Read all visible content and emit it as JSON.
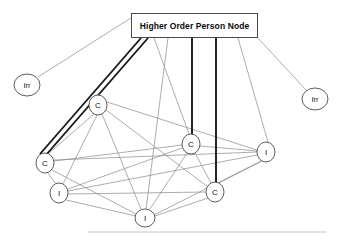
{
  "diagram": {
    "title_node": {
      "label": "Higher Order Person Node",
      "box": {
        "x": 131,
        "y": 13,
        "w": 127,
        "h": 25
      }
    },
    "nodes": [
      {
        "id": "irr_left",
        "label": "Irr",
        "name": "node-irr-left",
        "cx": 27,
        "cy": 85,
        "rx": 13,
        "ry": 11
      },
      {
        "id": "irr_right",
        "label": "Irr",
        "name": "node-irr-right",
        "cx": 315,
        "cy": 99,
        "rx": 13,
        "ry": 11
      },
      {
        "id": "c_top",
        "label": "C",
        "name": "node-c-upper-left",
        "cx": 98,
        "cy": 105,
        "rx": 9,
        "ry": 10
      },
      {
        "id": "c_mid",
        "label": "C",
        "name": "node-c-middle",
        "cx": 191,
        "cy": 144,
        "rx": 9,
        "ry": 10
      },
      {
        "id": "c_left",
        "label": "C",
        "name": "node-c-left",
        "cx": 45,
        "cy": 163,
        "rx": 9,
        "ry": 10
      },
      {
        "id": "i_right",
        "label": "I",
        "name": "node-i-right",
        "cx": 266,
        "cy": 152,
        "rx": 9,
        "ry": 10
      },
      {
        "id": "i_left",
        "label": "I",
        "name": "node-i-left",
        "cx": 59,
        "cy": 193,
        "rx": 9,
        "ry": 10
      },
      {
        "id": "c_bottom",
        "label": "C",
        "name": "node-c-bottom",
        "cx": 215,
        "cy": 192,
        "rx": 9,
        "ry": 10
      },
      {
        "id": "i_bottom",
        "label": "I",
        "name": "node-i-bottom",
        "cx": 145,
        "cy": 218,
        "rx": 10,
        "ry": 9
      }
    ],
    "edges_thin": [
      {
        "name": "edge-title-to-irr-left",
        "x1": 134,
        "y1": 16,
        "x2": 38,
        "y2": 77
      },
      {
        "name": "edge-title-to-irr-right",
        "x1": 256,
        "y1": 36,
        "x2": 307,
        "y2": 91
      },
      {
        "name": "edge-title-to-c-mid",
        "x1": 154,
        "y1": 38,
        "x2": 189,
        "y2": 134
      },
      {
        "name": "edge-title-to-i-bottom",
        "x1": 168,
        "y1": 38,
        "x2": 146,
        "y2": 209
      },
      {
        "name": "edge-title-to-i-right",
        "x1": 238,
        "y1": 38,
        "x2": 268,
        "y2": 142
      },
      {
        "name": "edge-c-top-to-i-right",
        "x1": 107,
        "y1": 102,
        "x2": 257,
        "y2": 150
      },
      {
        "name": "edge-c-top-to-c-left",
        "x1": 94,
        "y1": 114,
        "x2": 48,
        "y2": 154
      },
      {
        "name": "edge-c-top-to-i-left",
        "x1": 97,
        "y1": 115,
        "x2": 63,
        "y2": 184
      },
      {
        "name": "edge-c-top-to-i-bottom",
        "x1": 102,
        "y1": 114,
        "x2": 141,
        "y2": 209
      },
      {
        "name": "edge-c-top-to-c-bottom",
        "x1": 106,
        "y1": 110,
        "x2": 208,
        "y2": 187
      },
      {
        "name": "edge-c-left-to-c-mid",
        "x1": 54,
        "y1": 161,
        "x2": 182,
        "y2": 145
      },
      {
        "name": "edge-c-left-to-i-right",
        "x1": 54,
        "y1": 160,
        "x2": 257,
        "y2": 152
      },
      {
        "name": "edge-c-left-to-i-left",
        "x1": 47,
        "y1": 172,
        "x2": 56,
        "y2": 184
      },
      {
        "name": "edge-c-left-to-i-bottom",
        "x1": 52,
        "y1": 170,
        "x2": 136,
        "y2": 214
      },
      {
        "name": "edge-c-mid-to-i-right",
        "x1": 200,
        "y1": 146,
        "x2": 257,
        "y2": 151
      },
      {
        "name": "edge-c-mid-to-i-left",
        "x1": 182,
        "y1": 148,
        "x2": 68,
        "y2": 189
      },
      {
        "name": "edge-c-mid-to-i-bottom",
        "x1": 187,
        "y1": 153,
        "x2": 150,
        "y2": 209
      },
      {
        "name": "edge-c-mid-to-c-bottom",
        "x1": 195,
        "y1": 153,
        "x2": 211,
        "y2": 183
      },
      {
        "name": "edge-i-right-to-i-left",
        "x1": 257,
        "y1": 155,
        "x2": 68,
        "y2": 191
      },
      {
        "name": "edge-i-right-to-c-bottom",
        "x1": 262,
        "y1": 161,
        "x2": 219,
        "y2": 183
      },
      {
        "name": "edge-i-right-to-i-bottom",
        "x1": 261,
        "y1": 161,
        "x2": 154,
        "y2": 215
      },
      {
        "name": "edge-i-left-to-c-bottom",
        "x1": 68,
        "y1": 194,
        "x2": 206,
        "y2": 192
      },
      {
        "name": "edge-i-left-to-i-bottom",
        "x1": 66,
        "y1": 200,
        "x2": 136,
        "y2": 216
      },
      {
        "name": "edge-c-bottom-to-i-bottom",
        "x1": 208,
        "y1": 198,
        "x2": 155,
        "y2": 216
      }
    ],
    "edges_bold": [
      {
        "name": "edge-bold-title-to-c-left-outer",
        "x1": 141,
        "y1": 38,
        "x2": 40,
        "y2": 154
      },
      {
        "name": "edge-bold-title-to-c-left-inner",
        "x1": 148,
        "y1": 38,
        "x2": 46,
        "y2": 155
      },
      {
        "name": "edge-bold-title-to-c-mid",
        "x1": 192,
        "y1": 38,
        "x2": 192,
        "y2": 135
      },
      {
        "name": "edge-bold-title-to-c-bottom",
        "x1": 216,
        "y1": 38,
        "x2": 216,
        "y2": 183
      }
    ],
    "footer_rule": {
      "x1": 88,
      "y1": 232,
      "x2": 326,
      "y2": 232
    }
  }
}
